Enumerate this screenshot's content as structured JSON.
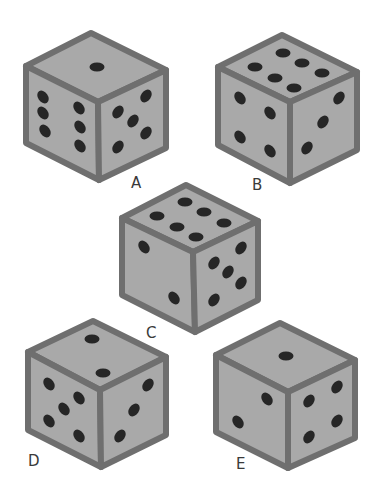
{
  "figure": {
    "type": "dice-puzzle",
    "pip_color": "#262626",
    "face_color": "#a9a9a9",
    "edge_color": "#6f6f6f"
  },
  "dice": [
    {
      "label": "A",
      "faces": {
        "top": 1,
        "left": 6,
        "right": 5
      },
      "geom": {
        "top": [
          91,
          33
        ],
        "tl": [
          26,
          66
        ],
        "tr": [
          166,
          70
        ],
        "c": [
          98,
          102
        ],
        "bl": [
          26,
          143
        ],
        "br": [
          166,
          148
        ],
        "b": [
          99,
          180
        ]
      },
      "label_pos": [
        131,
        174
      ],
      "pips": {
        "top": [
          [
            97,
            67
          ]
        ],
        "left": [
          [
            43,
            97
          ],
          [
            43,
            113
          ],
          [
            45,
            131
          ],
          [
            79,
            108
          ],
          [
            80,
            127
          ],
          [
            80,
            146
          ]
        ],
        "right": [
          [
            146,
            96
          ],
          [
            118,
            112
          ],
          [
            133,
            121
          ],
          [
            146,
            133
          ],
          [
            118,
            147
          ]
        ]
      }
    },
    {
      "label": "B",
      "faces": {
        "top": 6,
        "left": 4,
        "right": 3
      },
      "geom": {
        "top": [
          282,
          35
        ],
        "tl": [
          218,
          67
        ],
        "tr": [
          357,
          72
        ],
        "c": [
          290,
          102
        ],
        "bl": [
          218,
          145
        ],
        "br": [
          357,
          150
        ],
        "b": [
          290,
          183
        ]
      },
      "label_pos": [
        252,
        176
      ],
      "pips": {
        "top": [
          [
            283,
            53
          ],
          [
            255,
            67
          ],
          [
            302,
            63
          ],
          [
            275,
            78
          ],
          [
            322,
            73
          ],
          [
            294,
            88
          ]
        ],
        "left": [
          [
            240,
            98
          ],
          [
            270,
            113
          ],
          [
            240,
            137
          ],
          [
            270,
            151
          ]
        ],
        "right": [
          [
            339,
            98
          ],
          [
            323,
            122
          ],
          [
            307,
            148
          ]
        ]
      }
    },
    {
      "label": "C",
      "faces": {
        "top": 6,
        "left": 2,
        "right": 5
      },
      "geom": {
        "top": [
          186,
          185
        ],
        "tl": [
          122,
          218
        ],
        "tr": [
          258,
          221
        ],
        "c": [
          193,
          252
        ],
        "bl": [
          122,
          295
        ],
        "br": [
          258,
          300
        ],
        "b": [
          195,
          332
        ]
      },
      "label_pos": [
        146,
        324
      ],
      "pips": {
        "top": [
          [
            185,
            202
          ],
          [
            157,
            216
          ],
          [
            204,
            212
          ],
          [
            177,
            227
          ],
          [
            224,
            223
          ],
          [
            196,
            237
          ]
        ],
        "left": [
          [
            144,
            247
          ],
          [
            174,
            298
          ]
        ],
        "right": [
          [
            241,
            248
          ],
          [
            214,
            263
          ],
          [
            228,
            272
          ],
          [
            241,
            283
          ],
          [
            214,
            300
          ]
        ]
      }
    },
    {
      "label": "D",
      "faces": {
        "top": 2,
        "left": 5,
        "right": 3
      },
      "geom": {
        "top": [
          93,
          321
        ],
        "tl": [
          28,
          352
        ],
        "tr": [
          166,
          357
        ],
        "c": [
          100,
          390
        ],
        "bl": [
          28,
          430
        ],
        "br": [
          166,
          435
        ],
        "b": [
          101,
          467
        ]
      },
      "label_pos": [
        28,
        452
      ],
      "pips": {
        "top": [
          [
            92,
            339
          ],
          [
            103,
            373
          ]
        ],
        "left": [
          [
            49,
            384
          ],
          [
            79,
            398
          ],
          [
            64,
            409
          ],
          [
            49,
            421
          ],
          [
            79,
            436
          ]
        ],
        "right": [
          [
            148,
            385
          ],
          [
            134,
            410
          ],
          [
            120,
            436
          ]
        ]
      }
    },
    {
      "label": "E",
      "faces": {
        "top": 1,
        "left": 2,
        "right": 4
      },
      "geom": {
        "top": [
          280,
          323
        ],
        "tl": [
          216,
          355
        ],
        "tr": [
          355,
          360
        ],
        "c": [
          288,
          392
        ],
        "bl": [
          216,
          432
        ],
        "br": [
          355,
          438
        ],
        "b": [
          288,
          468
        ]
      },
      "label_pos": [
        236,
        455
      ],
      "pips": {
        "top": [
          [
            286,
            356
          ]
        ],
        "left": [
          [
            267,
            399
          ],
          [
            238,
            422
          ]
        ],
        "right": [
          [
            337,
            387
          ],
          [
            309,
            401
          ],
          [
            337,
            421
          ],
          [
            309,
            437
          ]
        ]
      }
    }
  ]
}
